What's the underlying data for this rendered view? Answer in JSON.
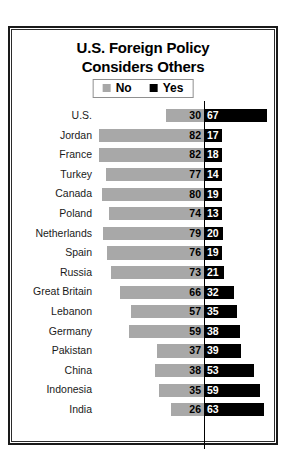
{
  "chart_data": {
    "type": "bar",
    "orientation": "horizontal-diverging",
    "title": "U.S. Foreign Policy Considers Others",
    "title_lines": [
      "U.S. Foreign Policy",
      "Considers Others"
    ],
    "xlabel": "",
    "ylabel": "",
    "grid": false,
    "legend_position": "top-center",
    "categories": [
      "U.S.",
      "Jordan",
      "France",
      "Turkey",
      "Canada",
      "Poland",
      "Netherlands",
      "Spain",
      "Russia",
      "Great Britain",
      "Lebanon",
      "Germany",
      "Pakistan",
      "China",
      "Indonesia",
      "India"
    ],
    "series": [
      {
        "name": "No",
        "color": "#a8a8a8",
        "direction": "left",
        "values": [
          30,
          82,
          82,
          77,
          80,
          74,
          79,
          76,
          73,
          66,
          57,
          59,
          37,
          38,
          35,
          26
        ]
      },
      {
        "name": "Yes",
        "color": "#000000",
        "direction": "right",
        "values": [
          67,
          17,
          18,
          14,
          19,
          13,
          20,
          19,
          21,
          32,
          35,
          38,
          39,
          53,
          59,
          63
        ]
      }
    ],
    "axis_max_left": 86,
    "axis_max_right": 72
  },
  "legend": {
    "items": [
      {
        "label": "No",
        "swatch": "no"
      },
      {
        "label": "Yes",
        "swatch": "yes"
      }
    ]
  },
  "colors": {
    "no": "#a8a8a8",
    "yes": "#000000",
    "frame": "#1a1a1a",
    "background": "#ffffff"
  }
}
